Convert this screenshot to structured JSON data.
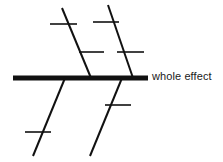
{
  "diagram": {
    "type": "fishbone-cause-and-effect",
    "title": "",
    "background_color": "#ffffff",
    "line_color": "#111111",
    "text_color": "#1a1a1a",
    "effect_label": "whole effect",
    "spine": {
      "name": "spine",
      "x1": 13,
      "y1": 78,
      "x2": 148,
      "y2": 78,
      "thickness": 5
    },
    "branches": [
      {
        "name": "upper-left-branch",
        "position": "upper-left",
        "x1": 62,
        "y1": 8,
        "x2": 91,
        "y2": 78,
        "thickness": 2,
        "ribs": [
          {
            "name": "upper-left-rib-1",
            "x1": 50,
            "y1": 24,
            "x2": 77,
            "y2": 24,
            "thickness": 1.6
          },
          {
            "name": "upper-left-rib-2",
            "x1": 79,
            "y1": 52,
            "x2": 104,
            "y2": 52,
            "thickness": 1.6
          }
        ]
      },
      {
        "name": "upper-right-branch",
        "position": "upper-right",
        "x1": 108,
        "y1": 5,
        "x2": 133,
        "y2": 78,
        "thickness": 2,
        "ribs": [
          {
            "name": "upper-right-rib-1",
            "x1": 93,
            "y1": 22,
            "x2": 119,
            "y2": 22,
            "thickness": 1.6
          },
          {
            "name": "upper-right-rib-2",
            "x1": 117,
            "y1": 52,
            "x2": 144,
            "y2": 52,
            "thickness": 1.6
          }
        ]
      },
      {
        "name": "lower-left-branch",
        "position": "lower-left",
        "x1": 65,
        "y1": 78,
        "x2": 33,
        "y2": 156,
        "thickness": 2,
        "ribs": [
          {
            "name": "lower-left-rib-1",
            "x1": 25,
            "y1": 132,
            "x2": 51,
            "y2": 132,
            "thickness": 1.6
          }
        ]
      },
      {
        "name": "lower-right-branch",
        "position": "lower-right",
        "x1": 122,
        "y1": 78,
        "x2": 90,
        "y2": 156,
        "thickness": 2,
        "ribs": [
          {
            "name": "lower-right-rib-1",
            "x1": 105,
            "y1": 105,
            "x2": 131,
            "y2": 105,
            "thickness": 1.6
          }
        ]
      }
    ]
  }
}
